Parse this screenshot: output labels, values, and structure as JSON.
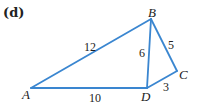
{
  "figure": {
    "part_label": "(d)",
    "edge_color": "#3a86d0",
    "vertices": [
      {
        "name": "A",
        "label": "A"
      },
      {
        "name": "B",
        "label": "B"
      },
      {
        "name": "C",
        "label": "C"
      },
      {
        "name": "D",
        "label": "D"
      }
    ],
    "edges": [
      {
        "from": "A",
        "to": "B",
        "length": "12"
      },
      {
        "from": "A",
        "to": "D",
        "length": "10"
      },
      {
        "from": "B",
        "to": "D",
        "length": "6"
      },
      {
        "from": "B",
        "to": "C",
        "length": "5"
      },
      {
        "from": "D",
        "to": "C",
        "length": "3"
      }
    ]
  }
}
